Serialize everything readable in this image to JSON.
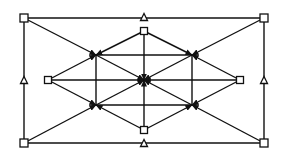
{
  "diagram": {
    "width": 288,
    "height": 159,
    "colors": {
      "stroke": "#111111",
      "background": "#ffffff"
    },
    "nodes": [
      {
        "id": "sq_tl",
        "shape": "square",
        "x": 24,
        "y": 18,
        "size": 8
      },
      {
        "id": "sq_tr",
        "shape": "square",
        "x": 264,
        "y": 18,
        "size": 8
      },
      {
        "id": "sq_bl",
        "shape": "square",
        "x": 24,
        "y": 143,
        "size": 8
      },
      {
        "id": "sq_br",
        "shape": "square",
        "x": 264,
        "y": 143,
        "size": 8
      },
      {
        "id": "sq_top",
        "shape": "square",
        "x": 144,
        "y": 31,
        "size": 7
      },
      {
        "id": "sq_bottom",
        "shape": "square",
        "x": 144,
        "y": 130,
        "size": 7
      },
      {
        "id": "sq_left",
        "shape": "square",
        "x": 48,
        "y": 80,
        "size": 7
      },
      {
        "id": "sq_right",
        "shape": "square",
        "x": 240,
        "y": 80,
        "size": 7
      },
      {
        "id": "tri_top",
        "shape": "triangle",
        "x": 144,
        "y": 17,
        "size": 7
      },
      {
        "id": "tri_bottom",
        "shape": "triangle",
        "x": 144,
        "y": 143,
        "size": 7
      },
      {
        "id": "tri_left",
        "shape": "triangle",
        "x": 24,
        "y": 80,
        "size": 7
      },
      {
        "id": "tri_right",
        "shape": "triangle",
        "x": 264,
        "y": 80,
        "size": 7
      },
      {
        "id": "j_center",
        "shape": "junction",
        "x": 144,
        "y": 80
      },
      {
        "id": "j_ul",
        "shape": "junction",
        "x": 96,
        "y": 55
      },
      {
        "id": "j_ur",
        "shape": "junction",
        "x": 192,
        "y": 55
      },
      {
        "id": "j_ll",
        "shape": "junction",
        "x": 96,
        "y": 105
      },
      {
        "id": "j_lr",
        "shape": "junction",
        "x": 192,
        "y": 105
      }
    ],
    "edges": [
      {
        "from": "sq_tl",
        "to": "sq_tr",
        "arrow": false
      },
      {
        "from": "sq_bl",
        "to": "sq_br",
        "arrow": false
      },
      {
        "from": "sq_tl",
        "to": "sq_bl",
        "arrow": false
      },
      {
        "from": "sq_tr",
        "to": "sq_br",
        "arrow": false
      },
      {
        "from": "sq_tl",
        "to": "j_ul",
        "arrow": true
      },
      {
        "from": "sq_tr",
        "to": "j_ur",
        "arrow": true
      },
      {
        "from": "sq_bl",
        "to": "j_ll",
        "arrow": true
      },
      {
        "from": "sq_br",
        "to": "j_lr",
        "arrow": true
      },
      {
        "from": "sq_top",
        "to": "j_ul",
        "arrow": true
      },
      {
        "from": "sq_top",
        "to": "j_ur",
        "arrow": true
      },
      {
        "from": "sq_top",
        "to": "j_center",
        "arrow": true
      },
      {
        "from": "sq_bottom",
        "to": "j_ll",
        "arrow": true
      },
      {
        "from": "sq_bottom",
        "to": "j_lr",
        "arrow": true
      },
      {
        "from": "sq_bottom",
        "to": "j_center",
        "arrow": true
      },
      {
        "from": "sq_left",
        "to": "j_ul",
        "arrow": true
      },
      {
        "from": "sq_left",
        "to": "j_ll",
        "arrow": true
      },
      {
        "from": "sq_left",
        "to": "j_center",
        "arrow": true
      },
      {
        "from": "sq_right",
        "to": "j_ur",
        "arrow": true
      },
      {
        "from": "sq_right",
        "to": "j_lr",
        "arrow": true
      },
      {
        "from": "sq_right",
        "to": "j_center",
        "arrow": true
      },
      {
        "from": "j_ul",
        "to": "j_center",
        "arrow": true
      },
      {
        "from": "j_ur",
        "to": "j_center",
        "arrow": true
      },
      {
        "from": "j_ll",
        "to": "j_center",
        "arrow": true
      },
      {
        "from": "j_lr",
        "to": "j_center",
        "arrow": true
      },
      {
        "from": "sq_top",
        "to": "sq_right",
        "arrow": false,
        "note": "inner diamond"
      },
      {
        "from": "j_ul",
        "to": "j_ur",
        "arrow": false
      },
      {
        "from": "j_ll",
        "to": "j_lr",
        "arrow": false
      },
      {
        "from": "j_ul",
        "to": "j_ll",
        "arrow": false
      },
      {
        "from": "j_ur",
        "to": "j_lr",
        "arrow": false
      }
    ]
  }
}
